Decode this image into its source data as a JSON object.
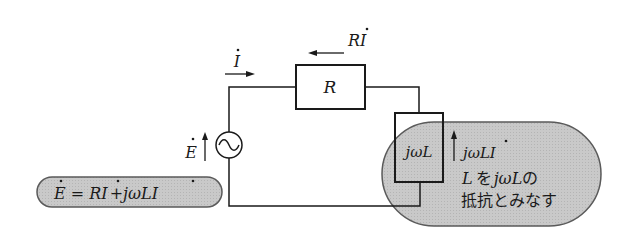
{
  "diagram": {
    "type": "circuit",
    "title": "",
    "current_label": {
      "base": "I",
      "dot": "˙"
    },
    "resistor": {
      "label": "R"
    },
    "resistor_voltage": {
      "label": "RI",
      "dot_on": "I"
    },
    "source": {
      "label": "E",
      "symbol": "~"
    },
    "inductor": {
      "label": "jωL"
    },
    "inductor_voltage": {
      "label": "jωLI"
    },
    "equation": {
      "text": "Ė = Rİ + jωLİ",
      "lhs": "E",
      "eq": " = ",
      "t1": "RI",
      "plus": "+",
      "t2": "jωLI"
    },
    "note": {
      "line1_a": "L",
      "line1_b": "を",
      "line1_c": "jωL",
      "line1_d": "の",
      "line2": "抵抗とみなす"
    },
    "colors": {
      "line": "#1a1a1a",
      "callout_fill": "#c8c8c8",
      "callout_stroke": "#5a5a5a",
      "background": "#ffffff"
    }
  }
}
